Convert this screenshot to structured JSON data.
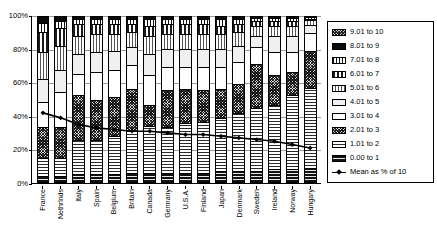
{
  "chart_data": {
    "type": "bar",
    "subtype": "100% stacked bar with overlaid line",
    "title": "",
    "xlabel": "",
    "ylabel": "",
    "ylim": [
      0,
      100
    ],
    "ytick_labels": [
      "0%",
      "20%",
      "40%",
      "60%",
      "80%",
      "100%"
    ],
    "ytick_values": [
      0,
      20,
      40,
      60,
      80,
      100
    ],
    "grid": true,
    "legend_position": "right",
    "categories": [
      "France",
      "Nethrlnds",
      "Italy",
      "Spain",
      "Belgium",
      "Britain",
      "Canada",
      "Germany",
      "U.S.A.",
      "Finland",
      "Japan",
      "Denmark",
      "Sweden",
      "Ireland",
      "Norway",
      "Hungary"
    ],
    "series": [
      {
        "name": "0.00 to 1",
        "values": [
          3,
          3,
          4,
          4,
          4,
          5,
          5,
          5,
          5,
          5,
          6,
          6,
          6,
          7,
          7,
          8
        ]
      },
      {
        "name": "1.01 to 2",
        "values": [
          11,
          11,
          21,
          21,
          23,
          25,
          28,
          28,
          30,
          31,
          32,
          35,
          38,
          39,
          45,
          49
        ]
      },
      {
        "name": "2.01 to 3",
        "values": [
          19,
          19,
          27,
          24,
          24,
          26,
          13,
          22,
          21,
          19,
          18,
          18,
          27,
          18,
          14,
          22
        ]
      },
      {
        "name": "3.01 to 4",
        "values": [
          15,
          21,
          13,
          17,
          16,
          14,
          18,
          14,
          13,
          14,
          13,
          13,
          10,
          14,
          12,
          11
        ]
      },
      {
        "name": "4.01 to 5",
        "values": [
          14,
          13,
          12,
          12,
          12,
          11,
          13,
          11,
          11,
          11,
          11,
          10,
          7,
          10,
          10,
          5
        ]
      },
      {
        "name": "5.01 to 6",
        "values": [
          16,
          15,
          11,
          11,
          10,
          9,
          11,
          9,
          9,
          9,
          9,
          8,
          6,
          6,
          6,
          3
        ]
      },
      {
        "name": "6.01 to 7",
        "values": [
          12,
          11,
          7,
          6,
          6,
          5,
          6,
          6,
          6,
          6,
          5,
          5,
          3,
          3,
          3,
          1
        ]
      },
      {
        "name": "7.01 to 8",
        "values": [
          6,
          4,
          3,
          3,
          3,
          3,
          4,
          3,
          3,
          3,
          4,
          3,
          2,
          2,
          2,
          1
        ]
      },
      {
        "name": "8.01 to 9",
        "values": [
          4,
          3,
          2,
          2,
          2,
          2,
          2,
          2,
          2,
          2,
          2,
          2,
          1,
          1,
          1,
          0
        ]
      }
    ],
    "line_series": {
      "name": "Mean as % of 10",
      "values": [
        42,
        39,
        35,
        33,
        32,
        31,
        31,
        30,
        29,
        29,
        28,
        27,
        26,
        25,
        23,
        21
      ]
    }
  },
  "axis": {
    "y_ticks": [
      {
        "label": "100%",
        "value": 100
      },
      {
        "label": "80%",
        "value": 80
      },
      {
        "label": "60%",
        "value": 60
      },
      {
        "label": "40%",
        "value": 40
      },
      {
        "label": "20%",
        "value": 20
      },
      {
        "label": "0%",
        "value": 0
      }
    ]
  },
  "legend": {
    "items": [
      {
        "label": "9.01 to 10",
        "swatch": "pattern-dense-checker"
      },
      {
        "label": "8.01 to 9",
        "swatch": "pattern-solid-black"
      },
      {
        "label": "7.01 to 8",
        "swatch": "pattern-fine-grid"
      },
      {
        "label": "6.01 to 7",
        "swatch": "pattern-vertical-bars"
      },
      {
        "label": "5.01 to 6",
        "swatch": "pattern-vertical-lines"
      },
      {
        "label": "4.01 to 5",
        "swatch": "pattern-light-grey"
      },
      {
        "label": "3.01 to 4",
        "swatch": "pattern-white"
      },
      {
        "label": "2.01 to 3",
        "swatch": "pattern-checker"
      },
      {
        "label": "1.01 to 2",
        "swatch": "pattern-horizontal-lines"
      },
      {
        "label": "0.00 to 1",
        "swatch": "pattern-solid-dark"
      }
    ],
    "line_item": {
      "label": "Mean as % of 10",
      "marker": "line-with-diamond"
    }
  }
}
